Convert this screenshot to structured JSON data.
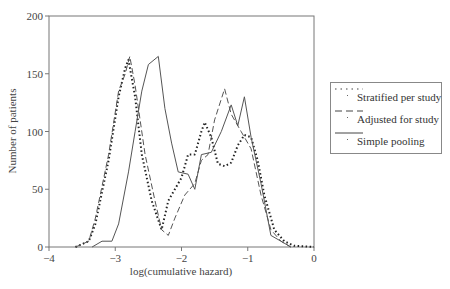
{
  "chart_data": {
    "type": "line",
    "title": "",
    "xlabel": "log(cumulative hazard)",
    "ylabel": "Number of patients",
    "xlim": [
      -4,
      0
    ],
    "ylim": [
      0,
      200
    ],
    "xticks": [
      -4,
      -3,
      -2,
      -1,
      0
    ],
    "yticks": [
      0,
      50,
      100,
      150,
      200
    ],
    "xtick_labels": [
      "−4",
      "−3",
      "−2",
      "−1",
      "0"
    ],
    "ytick_labels": [
      "0",
      "50",
      "100",
      "150",
      "200"
    ],
    "grid": false,
    "legend_position": "right-outside",
    "series": [
      {
        "name": "Stratified per study",
        "style": "dotted",
        "x": [
          -3.6,
          -3.4,
          -3.3,
          -3.1,
          -2.95,
          -2.85,
          -2.8,
          -2.7,
          -2.6,
          -2.45,
          -2.3,
          -2.2,
          -2.0,
          -1.9,
          -1.8,
          -1.7,
          -1.65,
          -1.55,
          -1.45,
          -1.35,
          -1.25,
          -1.15,
          -1.05,
          -0.95,
          -0.85,
          -0.75,
          -0.6,
          -0.45,
          -0.3,
          0.0
        ],
        "y": [
          0,
          5,
          20,
          75,
          130,
          155,
          162,
          130,
          80,
          40,
          15,
          40,
          60,
          80,
          80,
          100,
          108,
          95,
          72,
          70,
          73,
          88,
          97,
          95,
          75,
          45,
          15,
          5,
          1,
          0
        ]
      },
      {
        "name": "Adjusted for study",
        "style": "dashed",
        "x": [
          -3.6,
          -3.4,
          -3.3,
          -3.1,
          -2.95,
          -2.85,
          -2.78,
          -2.7,
          -2.55,
          -2.4,
          -2.3,
          -2.2,
          -2.1,
          -1.95,
          -1.8,
          -1.7,
          -1.6,
          -1.5,
          -1.35,
          -1.25,
          -1.1,
          -0.95,
          -0.8,
          -0.65,
          -0.5,
          -0.35
        ],
        "y": [
          0,
          5,
          25,
          80,
          135,
          150,
          165,
          140,
          80,
          40,
          15,
          10,
          25,
          45,
          55,
          75,
          80,
          110,
          137,
          115,
          100,
          85,
          45,
          15,
          5,
          0
        ]
      },
      {
        "name": "Simple pooling",
        "style": "solid",
        "x": [
          -3.35,
          -3.2,
          -3.05,
          -2.95,
          -2.8,
          -2.7,
          -2.6,
          -2.5,
          -2.35,
          -2.25,
          -2.15,
          -2.05,
          -1.9,
          -1.8,
          -1.7,
          -1.55,
          -1.4,
          -1.25,
          -1.15,
          -1.05,
          -0.95,
          -0.8,
          -0.65,
          -0.5,
          -0.35
        ],
        "y": [
          0,
          5,
          5,
          20,
          65,
          100,
          135,
          158,
          165,
          120,
          90,
          65,
          63,
          50,
          80,
          82,
          100,
          123,
          105,
          130,
          95,
          55,
          10,
          5,
          0
        ]
      }
    ]
  },
  "legend": {
    "items": [
      {
        "label": "Stratified per study"
      },
      {
        "label": "Adjusted for study"
      },
      {
        "label": "Simple pooling"
      }
    ]
  }
}
